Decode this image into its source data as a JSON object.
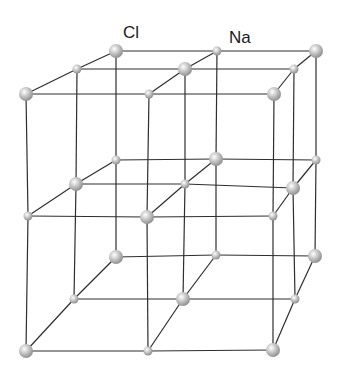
{
  "diagram": {
    "labels": [
      {
        "text": "Cl",
        "x": 123,
        "y": 24
      },
      {
        "text": "Na",
        "x": 229,
        "y": 29
      }
    ],
    "colors": {
      "background": "#ffffff",
      "edge": "#2e2e2e",
      "ion_highlight": "#ffffff",
      "ion_mid": "#c8c8c8",
      "ion_shadow": "#8a8a8a"
    },
    "ion_radius": {
      "Cl": 7,
      "Na": 4.5
    },
    "layers": [
      {
        "name": "top",
        "rows": [
          {
            "name": "back",
            "nodes": [
              {
                "x": 116,
                "y": 51,
                "ion": "Cl"
              },
              {
                "x": 217,
                "y": 51,
                "ion": "Na"
              },
              {
                "x": 316,
                "y": 51,
                "ion": "Cl"
              }
            ]
          },
          {
            "name": "mid",
            "nodes": [
              {
                "x": 77,
                "y": 69,
                "ion": "Na"
              },
              {
                "x": 185,
                "y": 69,
                "ion": "Cl"
              },
              {
                "x": 294,
                "y": 69,
                "ion": "Na"
              }
            ]
          },
          {
            "name": "front",
            "nodes": [
              {
                "x": 26,
                "y": 94,
                "ion": "Cl"
              },
              {
                "x": 149,
                "y": 94,
                "ion": "Na"
              },
              {
                "x": 274,
                "y": 94,
                "ion": "Cl"
              }
            ]
          }
        ]
      },
      {
        "name": "middle",
        "rows": [
          {
            "name": "back",
            "nodes": [
              {
                "x": 116,
                "y": 160,
                "ion": "Na"
              },
              {
                "x": 216,
                "y": 159,
                "ion": "Cl"
              },
              {
                "x": 316,
                "y": 160,
                "ion": "Na"
              }
            ]
          },
          {
            "name": "mid",
            "nodes": [
              {
                "x": 76,
                "y": 184,
                "ion": "Cl"
              },
              {
                "x": 185,
                "y": 184,
                "ion": "Na"
              },
              {
                "x": 293,
                "y": 188,
                "ion": "Cl"
              }
            ]
          },
          {
            "name": "front",
            "nodes": [
              {
                "x": 28,
                "y": 216,
                "ion": "Na"
              },
              {
                "x": 147,
                "y": 217,
                "ion": "Cl"
              },
              {
                "x": 273,
                "y": 216,
                "ion": "Na"
              }
            ]
          }
        ]
      },
      {
        "name": "bottom",
        "rows": [
          {
            "name": "back",
            "nodes": [
              {
                "x": 116,
                "y": 257,
                "ion": "Cl"
              },
              {
                "x": 216,
                "y": 255,
                "ion": "Na"
              },
              {
                "x": 315,
                "y": 256,
                "ion": "Cl"
              }
            ]
          },
          {
            "name": "mid",
            "nodes": [
              {
                "x": 74,
                "y": 299,
                "ion": "Na"
              },
              {
                "x": 183,
                "y": 299,
                "ion": "Cl"
              },
              {
                "x": 295,
                "y": 299,
                "ion": "Na"
              }
            ]
          },
          {
            "name": "front",
            "nodes": [
              {
                "x": 26,
                "y": 351,
                "ion": "Cl"
              },
              {
                "x": 148,
                "y": 351,
                "ion": "Na"
              },
              {
                "x": 273,
                "y": 350,
                "ion": "Cl"
              }
            ]
          }
        ]
      }
    ]
  }
}
